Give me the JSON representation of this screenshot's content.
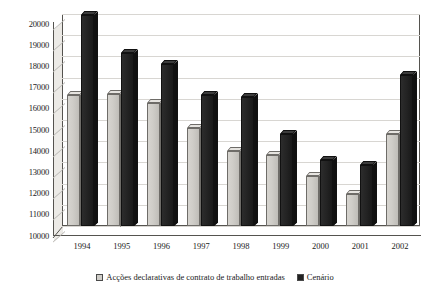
{
  "chart_data": {
    "type": "bar",
    "title": "",
    "xlabel": "",
    "ylabel": "",
    "ylim": [
      10000,
      20000
    ],
    "ytick_step": 1000,
    "grid": true,
    "legend_position": "bottom",
    "style": "3d-clustered-column",
    "categories": [
      "1994",
      "1995",
      "1996",
      "1997",
      "1998",
      "1999",
      "2000",
      "2001",
      "2002"
    ],
    "yticks": [
      "10000",
      "11000",
      "12000",
      "13000",
      "14000",
      "15000",
      "16000",
      "17000",
      "18000",
      "19000",
      "20000"
    ],
    "series": [
      {
        "name": "Acções declarativas de contrato de trabalho entradas",
        "color": "#cfcdc8",
        "values": [
          16200,
          16250,
          15800,
          14600,
          13550,
          13350,
          12350,
          11500,
          14350
        ]
      },
      {
        "name": "Cenário",
        "color": "#222222",
        "values": [
          19950,
          18150,
          17650,
          16200,
          16100,
          14350,
          13100,
          12900,
          17100
        ]
      }
    ]
  }
}
